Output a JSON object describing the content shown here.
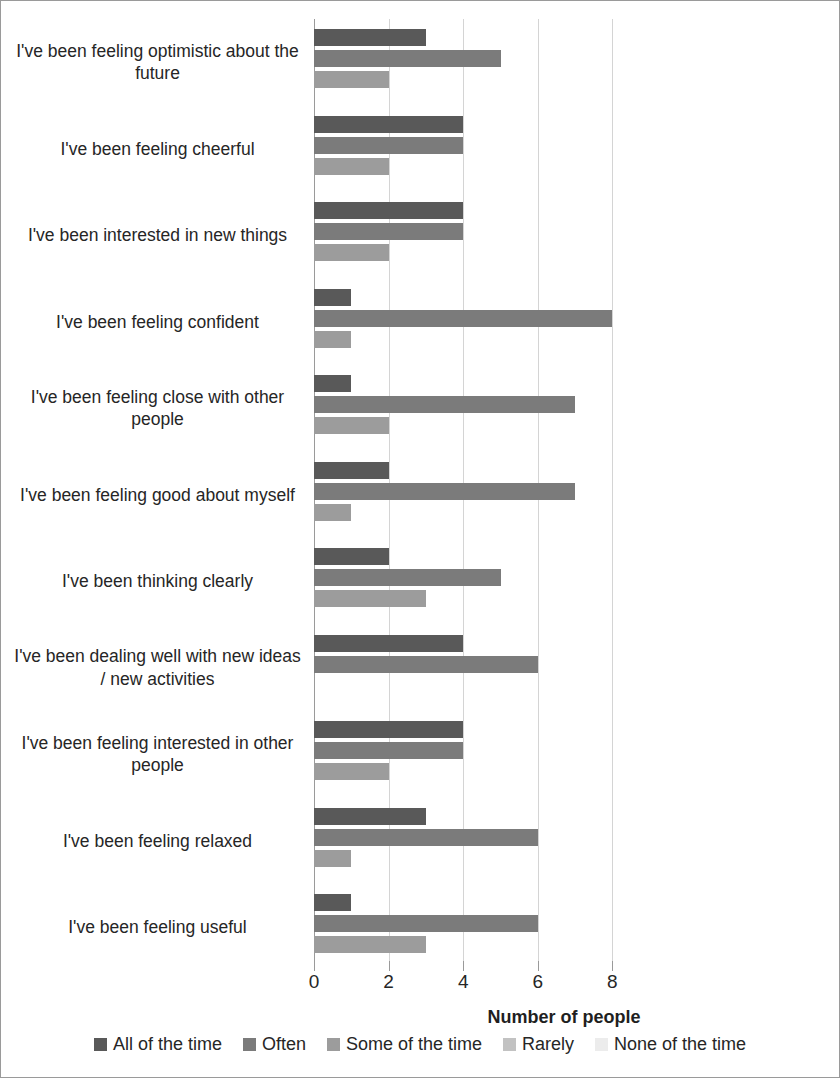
{
  "chart_data": {
    "type": "bar",
    "orientation": "horizontal",
    "title": "",
    "xlabel": "Number of people",
    "ylabel": "",
    "xlim": [
      0,
      8
    ],
    "xticks": [
      0,
      2,
      4,
      6,
      8
    ],
    "xtick_labels": [
      "0",
      "2",
      "4",
      "6",
      "8"
    ],
    "grid": true,
    "legend_position": "bottom",
    "categories": [
      "I've been feeling optimistic about the future",
      "I've been feeling cheerful",
      "I've been interested in new things",
      "I've been feeling confident",
      "I've been feeling close with other people",
      "I've been feeling good about myself",
      "I've been thinking clearly",
      "I've been dealing well with new ideas / new activities",
      "I've been feeling interested in other people",
      "I've been feeling relaxed",
      "I've been feeling useful"
    ],
    "series": [
      {
        "name": "All of the time",
        "color": "#595959",
        "values": [
          3,
          4,
          4,
          1,
          1,
          2,
          2,
          4,
          4,
          3,
          1
        ]
      },
      {
        "name": "Often",
        "color": "#7b7b7b",
        "values": [
          5,
          4,
          4,
          8,
          7,
          7,
          5,
          6,
          4,
          6,
          6
        ]
      },
      {
        "name": "Some of the time",
        "color": "#9c9c9c",
        "values": [
          2,
          2,
          2,
          1,
          2,
          1,
          3,
          0,
          2,
          1,
          3
        ]
      },
      {
        "name": "Rarely",
        "color": "#c2c2c2",
        "values": [
          0,
          0,
          0,
          0,
          0,
          0,
          0,
          0,
          0,
          0,
          0
        ]
      },
      {
        "name": "None of the time",
        "color": "#ececec",
        "values": [
          0,
          0,
          0,
          0,
          0,
          0,
          0,
          0,
          0,
          0,
          0
        ]
      }
    ]
  },
  "axis": {
    "x_title": "Number of people"
  },
  "legend": {
    "items": [
      {
        "label": "All of the time",
        "color": "#595959"
      },
      {
        "label": "Often",
        "color": "#7b7b7b"
      },
      {
        "label": "Some of the time",
        "color": "#9c9c9c"
      },
      {
        "label": "Rarely",
        "color": "#c2c2c2"
      },
      {
        "label": "None of the time",
        "color": "#ececec"
      }
    ]
  }
}
